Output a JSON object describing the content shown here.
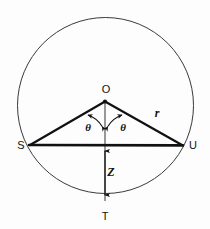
{
  "figure": {
    "background_color": "#fdfdfd",
    "stroke_color": "#111111",
    "circle": {
      "name": "circumscribed-circle",
      "cx": 105.5,
      "cy": 105.5,
      "r": 88,
      "stroke_width": 1
    },
    "points": [
      {
        "id": "O",
        "label": "O",
        "x": 105,
        "y": 101,
        "label_x": 106,
        "label_y": 89
      },
      {
        "id": "S",
        "label": "S",
        "x": 31,
        "y": 145,
        "label_x": 21,
        "label_y": 145
      },
      {
        "id": "U",
        "label": "U",
        "x": 181,
        "y": 145,
        "label_x": 193,
        "label_y": 145
      },
      {
        "id": "T",
        "label": "T",
        "x": 105,
        "y": 201,
        "label_x": 105,
        "label_y": 216
      }
    ],
    "segments": [
      {
        "id": "OS",
        "from": "O",
        "to": "S",
        "stroke_width": 2
      },
      {
        "id": "OU",
        "from": "U",
        "to": "O",
        "stroke_width": 2
      },
      {
        "id": "SU",
        "from": "S",
        "to": "U",
        "stroke_width": 2.4
      },
      {
        "id": "OT",
        "from": "O",
        "to": "T",
        "stroke_width": 1.2
      }
    ],
    "measures": [
      {
        "id": "radius",
        "label": "r",
        "x": 157,
        "y": 113,
        "applies_to": "OU"
      },
      {
        "id": "sagitta",
        "label": "Z",
        "x": 111,
        "y": 172,
        "applies_to": "chord-to-arc"
      }
    ],
    "angles": [
      {
        "id": "theta-left",
        "label": "θ",
        "x": 88,
        "y": 127,
        "at": "O",
        "between": "OT and OS"
      },
      {
        "id": "theta-right",
        "label": "θ",
        "x": 123,
        "y": 127,
        "at": "O",
        "between": "OT and OU"
      }
    ],
    "arrow_annotations": [
      {
        "id": "z-dimension-arrow",
        "x": 105,
        "y1": 146,
        "y2": 200,
        "double_headed": true
      },
      {
        "id": "theta-arc-left",
        "description": "arc with arrowheads from OT to OS"
      },
      {
        "id": "theta-arc-right",
        "description": "arc with arrowheads from OT to OU"
      }
    ]
  }
}
